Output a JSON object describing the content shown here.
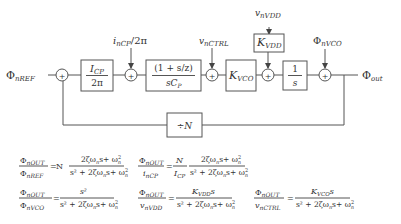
{
  "diagram": {
    "inputs": {
      "ref": {
        "main": "Φ",
        "sub": "nREF"
      },
      "cp_noise": {
        "main": "i",
        "sub": "nCP",
        "suffix": "/2π"
      },
      "ctrl_noise": {
        "main": "v",
        "sub": "nCTRL"
      },
      "vdd_noise": {
        "main": "v",
        "sub": "nVDD"
      },
      "vco_noise": {
        "main": "Φ",
        "sub": "nVCO"
      }
    },
    "output": {
      "main": "Φ",
      "sub": "out"
    },
    "blocks": {
      "charge_pump": {
        "num_main": "I",
        "num_sub": "CP",
        "den": "2π"
      },
      "loop_filter": {
        "num": "(1 + s/z)",
        "den_main": "sC",
        "den_sub": "P"
      },
      "kvco": {
        "main": "K",
        "sub": "VCO"
      },
      "kvdd": {
        "main": "K",
        "sub": "VDD"
      },
      "integrator": {
        "num": "1",
        "den": "s"
      },
      "divider": {
        "label": "÷N"
      }
    },
    "summer_symbol": "+"
  },
  "equations": [
    {
      "lhs_num": "Φ",
      "lhs_num_sub": "nOUT",
      "lhs_den": "Φ",
      "lhs_den_sub": "nREF",
      "factor": "N",
      "rhs_num": "2ζω",
      "rhs_num_tail": "s+ ω",
      "rhs_den": "s² + 2ζω",
      "rhs_den_tail": "s+ ω"
    },
    {
      "lhs_num": "Φ",
      "lhs_num_sub": "nOUT",
      "lhs_den": "i",
      "lhs_den_sub": "nCP",
      "factor_num": "N",
      "factor_den": "I",
      "factor_den_sub": "CP",
      "rhs_num": "2ζω",
      "rhs_num_tail": "s+ ω",
      "rhs_den": "s² + 2ζω",
      "rhs_den_tail": "s+ ω"
    },
    {
      "lhs_num": "Φ",
      "lhs_num_sub": "nOUT",
      "lhs_den": "Φ",
      "lhs_den_sub": "nVCO",
      "rhs_num": "s²",
      "rhs_den": "s² + 2ζω",
      "rhs_den_tail": "s+ ω"
    },
    {
      "lhs_num": "Φ",
      "lhs_num_sub": "nOUT",
      "lhs_den": "v",
      "lhs_den_sub": "nVDD",
      "rhs_num": "K",
      "rhs_num_sub": "VDD",
      "rhs_num_tail": "s",
      "rhs_den": "s² + 2ζω",
      "rhs_den_tail": "s+ ω"
    },
    {
      "lhs_num": "Φ",
      "lhs_num_sub": "nOUT",
      "lhs_den": "v",
      "lhs_den_sub": "nCTRL",
      "rhs_num": "K",
      "rhs_num_sub": "VCO",
      "rhs_num_tail": "s",
      "rhs_den": "s² + 2ζω",
      "rhs_den_tail": "s+ ω"
    }
  ],
  "eq_symbols": {
    "equals": "=",
    "n": "n",
    "two": "2"
  }
}
